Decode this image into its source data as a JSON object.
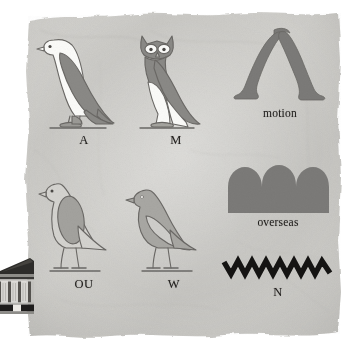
{
  "scene": {
    "kind": "egyptian-hieroglyph-chart",
    "background_color": "#ffffff",
    "parchment_color": "#c9c8c4",
    "parchment_edge_color": "#e8e8e6",
    "glyph_fill_dark": "#7b7a78",
    "glyph_fill_light": "#fbfbf9",
    "glyph_fill_mid": "#b9b8b3",
    "glyph_outline": "#6a6865",
    "ink_black": "#151413",
    "label_color": "#23211f"
  },
  "ornament": {
    "temple": {
      "name": "greek-temple-illustration",
      "pediment_color": "#2c2b29",
      "column_color": "#d9d8d4",
      "base_color": "#1b1a19",
      "column_count": 3
    }
  },
  "glyphs": [
    {
      "id": "a",
      "name": "vulture-glyph",
      "label": "A",
      "label_kind": "letter",
      "description": "standing vulture, white body with grey wing",
      "body_color": "#fbfbf9",
      "wing_color": "#8a8986",
      "outline_color": "#6a6865"
    },
    {
      "id": "m",
      "name": "owl-glyph",
      "label": "M",
      "label_kind": "letter",
      "description": "frontal-faced owl, grey head and wing, white legs and tail",
      "body_color": "#8a8986",
      "accent_color": "#fbfbf9",
      "outline_color": "#6a6865"
    },
    {
      "id": "motion",
      "name": "walking-legs-glyph",
      "label": "motion",
      "label_kind": "word",
      "description": "pair of striding legs forming an inverted V",
      "body_color": "#7b7a78",
      "outline_color": "#6a6865"
    },
    {
      "id": "ou",
      "name": "quail-chick-light-glyph",
      "label": "OU",
      "label_kind": "letter",
      "description": "standing bird, pale body with darker oval wing",
      "body_color": "#d4d3cf",
      "wing_color": "#a3a29e",
      "outline_color": "#6a6865"
    },
    {
      "id": "w",
      "name": "quail-chick-dark-glyph",
      "label": "W",
      "label_kind": "letter",
      "description": "standing bird, grey body with outlined pale wing",
      "body_color": "#a8a7a3",
      "wing_color": "#cfcecb",
      "outline_color": "#6a6865"
    },
    {
      "id": "overseas",
      "name": "hill-country-glyph",
      "label": "overseas",
      "label_kind": "word",
      "description": "solid block topped by three rounded mounds",
      "body_color": "#7b7a78",
      "mound_count": 3
    },
    {
      "id": "n",
      "name": "water-ripple-glyph",
      "label": "N",
      "label_kind": "letter",
      "description": "black zigzag water ripple line",
      "body_color": "#151413",
      "peak_count": 8
    }
  ]
}
